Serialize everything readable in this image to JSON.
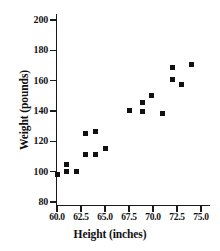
{
  "chart_data": {
    "type": "scatter",
    "title": "",
    "xlabel": "Height (inches)",
    "ylabel": "Weight (pounds)",
    "xlim": [
      59.0,
      75.6
    ],
    "ylim": [
      74.0,
      203.0
    ],
    "xticks": [
      60.0,
      62.5,
      65.0,
      67.5,
      70.0,
      72.5,
      75.0
    ],
    "xtick_labels": [
      "60.0",
      "62.5",
      "65.0",
      "67.5",
      "70.0",
      "72.5",
      "75.0"
    ],
    "yticks": [
      80,
      100,
      120,
      140,
      160,
      180,
      200
    ],
    "ytick_labels": [
      "80",
      "100",
      "120",
      "140",
      "160",
      "180",
      "200"
    ],
    "grid": false,
    "legend": false,
    "marker": "square",
    "marker_color": "#111111",
    "x": [
      60.0,
      61.0,
      61.0,
      62.0,
      63.0,
      63.0,
      64.0,
      64.0,
      65.0,
      67.5,
      68.9,
      68.9,
      69.8,
      71.0,
      72.0,
      72.0,
      73.0,
      74.0
    ],
    "y": [
      98,
      105,
      100,
      100,
      125,
      111,
      126.5,
      111,
      115.5,
      140.5,
      145.5,
      140,
      150.5,
      138.5,
      168.5,
      160.5,
      157.5,
      170.5
    ],
    "points": [
      {
        "x": 60.0,
        "y": 98
      },
      {
        "x": 61.0,
        "y": 105
      },
      {
        "x": 61.0,
        "y": 100
      },
      {
        "x": 62.0,
        "y": 100
      },
      {
        "x": 63.0,
        "y": 125
      },
      {
        "x": 63.0,
        "y": 111
      },
      {
        "x": 64.0,
        "y": 126.5
      },
      {
        "x": 64.0,
        "y": 111
      },
      {
        "x": 65.0,
        "y": 115.5
      },
      {
        "x": 67.5,
        "y": 140.5
      },
      {
        "x": 68.9,
        "y": 145.5
      },
      {
        "x": 68.9,
        "y": 140
      },
      {
        "x": 69.8,
        "y": 150.5
      },
      {
        "x": 71.0,
        "y": 138.5
      },
      {
        "x": 72.0,
        "y": 168.5
      },
      {
        "x": 72.0,
        "y": 160.5
      },
      {
        "x": 73.0,
        "y": 157.5
      },
      {
        "x": 74.0,
        "y": 170.5
      }
    ]
  },
  "colors": {
    "axis": "#1a1a1a",
    "text": "#111111",
    "marker": "#111111",
    "background": "#ffffff"
  }
}
